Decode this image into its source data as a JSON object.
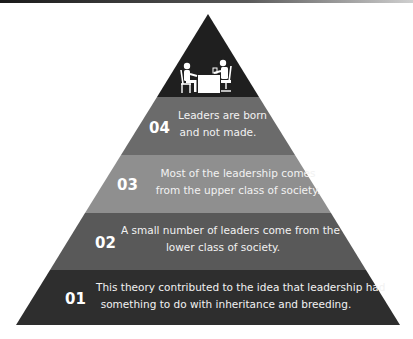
{
  "diagram": {
    "type": "pyramid",
    "colors": {
      "apex": "#1f1f1f",
      "band_04": "#6b6b6b",
      "band_03": "#8f8f8f",
      "band_02": "#595959",
      "band_01": "#2e2e2e"
    },
    "apex_icon": "interview-meeting-icon",
    "levels": [
      {
        "number": "04",
        "line1": "Leaders are born",
        "line2": "and not made."
      },
      {
        "number": "03",
        "line1": "Most of the leadership comes",
        "line2": "from the upper class of society."
      },
      {
        "number": "02",
        "line1": "A small number of leaders come from the",
        "line2": "lower class of society."
      },
      {
        "number": "01",
        "line1": "This theory contributed to the idea that leadership had",
        "line2": "something to do with inheritance and breeding."
      }
    ]
  }
}
